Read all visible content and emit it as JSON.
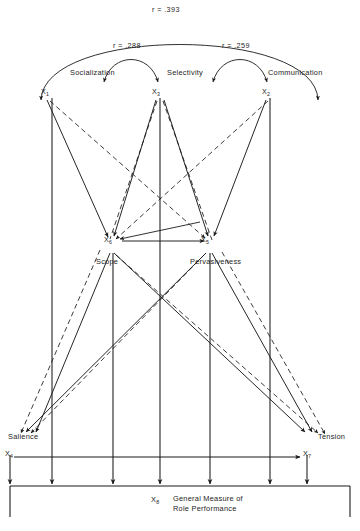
{
  "figure": {
    "type": "path-diagram",
    "line_styles": {
      "solid": "direct path",
      "dashed": "alternate path"
    },
    "colors": {
      "line": "#1a1a1a",
      "text": "#242424",
      "background": "#ffffff"
    }
  },
  "correlations": [
    {
      "id": "r-x1-x2",
      "label": "r = .393",
      "value": 0.393,
      "between": [
        "Socialization",
        "Communication"
      ]
    },
    {
      "id": "r-x1-x3",
      "label": "r = .288",
      "value": 0.288,
      "between": [
        "Socialization",
        "Selectivity"
      ]
    },
    {
      "id": "r-x3-x2",
      "label": "r = .259",
      "value": 0.259,
      "between": [
        "Selectivity",
        "Communication"
      ]
    }
  ],
  "nodes": {
    "top": [
      {
        "id": "x1",
        "var": "X",
        "sub": "1",
        "name": "Socialization"
      },
      {
        "id": "x3",
        "var": "X",
        "sub": "3",
        "name": "Selectivity"
      },
      {
        "id": "x2",
        "var": "X",
        "sub": "2",
        "name": "Communication"
      }
    ],
    "middle": [
      {
        "id": "x6",
        "var": "X",
        "sub": "6",
        "name": "Scope"
      },
      {
        "id": "x5",
        "var": "X",
        "sub": "5",
        "name": "Pervasiveness"
      }
    ],
    "lower": [
      {
        "id": "x4",
        "var": "X",
        "sub": "4",
        "name": "Salience"
      },
      {
        "id": "x7",
        "var": "X",
        "sub": "7",
        "name": "Tension"
      }
    ],
    "outcome": {
      "id": "x8",
      "var": "X",
      "sub": "8",
      "name_line1": "General Measure of",
      "name_line2": "Role Performance"
    }
  }
}
